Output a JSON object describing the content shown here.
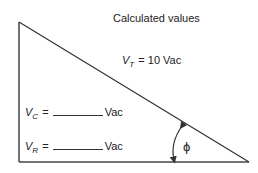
{
  "title": "Calculated values",
  "total_voltage": {
    "symbol": "V",
    "subscript": "T",
    "equals": "=",
    "value": "10 Vac"
  },
  "capacitor_voltage": {
    "symbol": "V",
    "subscript": "C",
    "equals": "=",
    "unit": "Vac"
  },
  "resistor_voltage": {
    "symbol": "V",
    "subscript": "R",
    "equals": "=",
    "unit": "Vac"
  },
  "angle_label": "ϕ",
  "colors": {
    "line": "#333333",
    "text": "#222222",
    "background": "#ffffff"
  }
}
